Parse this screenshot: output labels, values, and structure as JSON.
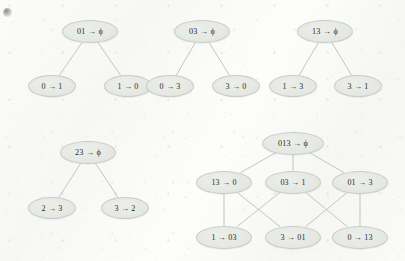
{
  "figure": {
    "background_color": "#f8f8f7",
    "node_fill": "#e6e8e4",
    "node_stroke": "#c9ccc6",
    "edge_color": "#b9bcb8",
    "text_color": "#2b2b2b",
    "arrow_glyph": "→",
    "empty_set_glyph": "ϕ"
  },
  "corner_mark": {
    "name": "page-corner-smudge"
  },
  "diagrams": [
    {
      "id": "tree-01",
      "type": "tree",
      "root": {
        "id": "n-01-root",
        "label": "01 → ϕ",
        "source": "01",
        "target": "ϕ",
        "x": 90,
        "y": 31,
        "rx": 28,
        "ry": 11.5,
        "font_size": 8.2
      },
      "children": [
        {
          "id": "n-01-a",
          "label": "0 → 1",
          "source": "0",
          "target": "1",
          "x": 52,
          "y": 86,
          "rx": 24,
          "ry": 11,
          "font_size": 8.0
        },
        {
          "id": "n-01-b",
          "label": "1 → 0",
          "source": "1",
          "target": "0",
          "x": 128,
          "y": 86,
          "rx": 24,
          "ry": 11,
          "font_size": 8.0
        }
      ],
      "edges": [
        {
          "from": "n-01-root",
          "to": "n-01-a"
        },
        {
          "from": "n-01-root",
          "to": "n-01-b"
        }
      ]
    },
    {
      "id": "tree-03",
      "type": "tree",
      "root": {
        "id": "n-03-root",
        "label": "03 → ϕ",
        "source": "03",
        "target": "ϕ",
        "x": 202,
        "y": 31,
        "rx": 28,
        "ry": 11.5,
        "font_size": 8.2
      },
      "children": [
        {
          "id": "n-03-a",
          "label": "0 → 3",
          "source": "0",
          "target": "3",
          "x": 170,
          "y": 86,
          "rx": 24,
          "ry": 11,
          "font_size": 8.0
        },
        {
          "id": "n-03-b",
          "label": "3 → 0",
          "source": "3",
          "target": "0",
          "x": 236,
          "y": 86,
          "rx": 24,
          "ry": 11,
          "font_size": 8.0
        }
      ],
      "edges": [
        {
          "from": "n-03-root",
          "to": "n-03-a"
        },
        {
          "from": "n-03-root",
          "to": "n-03-b"
        }
      ]
    },
    {
      "id": "tree-13",
      "type": "tree",
      "root": {
        "id": "n-13-root",
        "label": "13 → ϕ",
        "source": "13",
        "target": "ϕ",
        "x": 325,
        "y": 31,
        "rx": 28,
        "ry": 11.5,
        "font_size": 8.2
      },
      "children": [
        {
          "id": "n-13-a",
          "label": "1 → 3",
          "source": "1",
          "target": "3",
          "x": 293,
          "y": 86,
          "rx": 24,
          "ry": 11,
          "font_size": 8.0
        },
        {
          "id": "n-13-b",
          "label": "3 → 1",
          "source": "3",
          "target": "1",
          "x": 358,
          "y": 86,
          "rx": 24,
          "ry": 11,
          "font_size": 8.0
        }
      ],
      "edges": [
        {
          "from": "n-13-root",
          "to": "n-13-a"
        },
        {
          "from": "n-13-root",
          "to": "n-13-b"
        }
      ]
    },
    {
      "id": "tree-23",
      "type": "tree",
      "root": {
        "id": "n-23-root",
        "label": "23 → ϕ",
        "source": "23",
        "target": "ϕ",
        "x": 88,
        "y": 152,
        "rx": 28,
        "ry": 11.5,
        "font_size": 8.2
      },
      "children": [
        {
          "id": "n-23-a",
          "label": "2 → 3",
          "source": "2",
          "target": "3",
          "x": 52,
          "y": 208,
          "rx": 24,
          "ry": 11,
          "font_size": 8.0
        },
        {
          "id": "n-23-b",
          "label": "3 → 2",
          "source": "3",
          "target": "2",
          "x": 125,
          "y": 208,
          "rx": 24,
          "ry": 11,
          "font_size": 8.0
        }
      ],
      "edges": [
        {
          "from": "n-23-root",
          "to": "n-23-a"
        },
        {
          "from": "n-23-root",
          "to": "n-23-b"
        }
      ]
    },
    {
      "id": "lattice-013",
      "type": "lattice",
      "levels": [
        {
          "name": "top",
          "nodes": [
            {
              "id": "n-013-root",
              "label": "013 → ϕ",
              "source": "013",
              "target": "ϕ",
              "x": 293,
              "y": 143,
              "rx": 31,
              "ry": 11.5,
              "font_size": 8.2
            }
          ]
        },
        {
          "name": "middle",
          "nodes": [
            {
              "id": "n-13-0",
              "label": "13 → 0",
              "source": "13",
              "target": "0",
              "x": 224,
              "y": 182,
              "rx": 28,
              "ry": 11.5,
              "font_size": 8.0
            },
            {
              "id": "n-03-1",
              "label": "03 → 1",
              "source": "03",
              "target": "1",
              "x": 293,
              "y": 182,
              "rx": 28,
              "ry": 11.5,
              "font_size": 8.0
            },
            {
              "id": "n-01-3",
              "label": "01 → 3",
              "source": "01",
              "target": "3",
              "x": 360,
              "y": 182,
              "rx": 28,
              "ry": 11.5,
              "font_size": 8.0
            }
          ]
        },
        {
          "name": "bottom",
          "nodes": [
            {
              "id": "n-1-03",
              "label": "1 → 03",
              "source": "1",
              "target": "03",
              "x": 224,
              "y": 237,
              "rx": 28,
              "ry": 11.5,
              "font_size": 8.0
            },
            {
              "id": "n-3-01",
              "label": "3 → 01",
              "source": "3",
              "target": "01",
              "x": 293,
              "y": 237,
              "rx": 28,
              "ry": 11.5,
              "font_size": 8.0
            },
            {
              "id": "n-0-13",
              "label": "0 → 13",
              "source": "0",
              "target": "13",
              "x": 360,
              "y": 237,
              "rx": 28,
              "ry": 11.5,
              "font_size": 8.0
            }
          ]
        }
      ],
      "edges": [
        {
          "from": "n-013-root",
          "to": "n-13-0"
        },
        {
          "from": "n-013-root",
          "to": "n-03-1"
        },
        {
          "from": "n-013-root",
          "to": "n-01-3"
        },
        {
          "from": "n-13-0",
          "to": "n-1-03"
        },
        {
          "from": "n-13-0",
          "to": "n-3-01"
        },
        {
          "from": "n-03-1",
          "to": "n-1-03"
        },
        {
          "from": "n-03-1",
          "to": "n-0-13"
        },
        {
          "from": "n-01-3",
          "to": "n-3-01"
        },
        {
          "from": "n-01-3",
          "to": "n-0-13"
        }
      ]
    }
  ]
}
